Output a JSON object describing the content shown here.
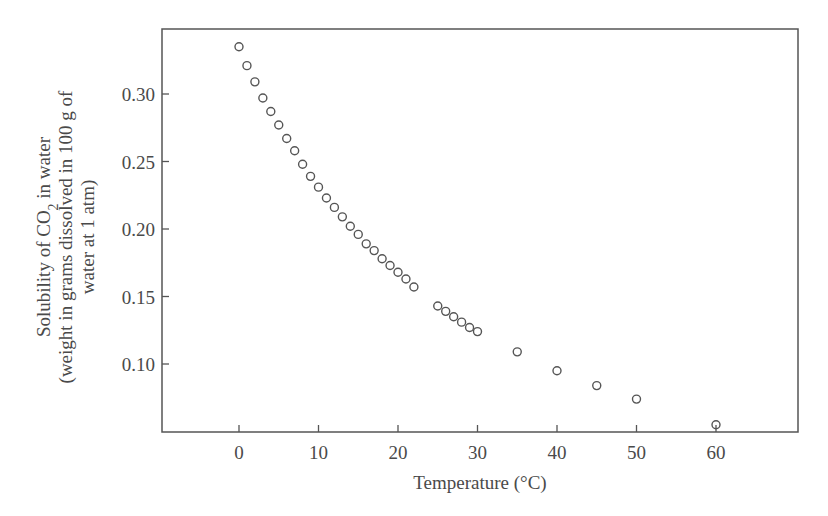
{
  "chart_data": {
    "type": "scatter",
    "title": "",
    "xlabel": "Temperature (°C)",
    "ylabel_lines": [
      "Solubility of CO₂ in water",
      "(weight in grams dissolved in 100 g of",
      "water at 1 atm)"
    ],
    "x_ticks": [
      0,
      10,
      20,
      30,
      40,
      50,
      60
    ],
    "y_ticks": [
      "0.10",
      "0.15",
      "0.20",
      "0.25",
      "0.30"
    ],
    "xlim": [
      -9.7,
      70
    ],
    "ylim": [
      0.049,
      0.347
    ],
    "grid": false,
    "legend": null,
    "marker": "open-circle",
    "series": [
      {
        "name": "CO2 solubility",
        "x": [
          0,
          1,
          2,
          3,
          4,
          5,
          6,
          7,
          8,
          9,
          10,
          11,
          12,
          13,
          14,
          15,
          16,
          17,
          18,
          19,
          20,
          21,
          22,
          25,
          26,
          27,
          28,
          29,
          30,
          35,
          40,
          45,
          50,
          60
        ],
        "y": [
          0.335,
          0.321,
          0.309,
          0.297,
          0.287,
          0.277,
          0.267,
          0.258,
          0.248,
          0.239,
          0.231,
          0.223,
          0.216,
          0.209,
          0.202,
          0.196,
          0.189,
          0.184,
          0.178,
          0.173,
          0.168,
          0.163,
          0.157,
          0.143,
          0.139,
          0.135,
          0.131,
          0.127,
          0.124,
          0.109,
          0.095,
          0.084,
          0.074,
          0.055
        ]
      }
    ]
  },
  "axes": {
    "x_label": "Temperature (°C)",
    "y_label_line1_pre": "Solubility of CO",
    "y_label_line1_sub": "2",
    "y_label_line1_post": " in water",
    "y_label_line2": "(weight in grams dissolved in 100 g of",
    "y_label_line3": "water at 1 atm)"
  }
}
